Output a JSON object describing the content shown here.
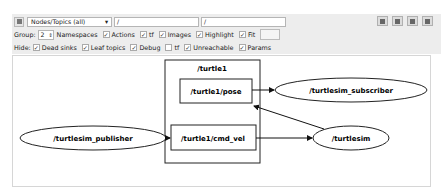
{
  "toolbar": {
    "refresh_icon": "refresh-graph-icon",
    "graph_type_select": "Nodes/Topics (all)",
    "node_filter_value": "/",
    "topic_filter_value": "/",
    "right_buttons": [
      "load-dot-icon",
      "save-dot-icon",
      "save-svg-icon",
      "save-image-icon"
    ]
  },
  "options_row": {
    "group_label": "Group:",
    "group_value": "2",
    "namespaces_label": "Namespaces",
    "namespaces_checked": true,
    "actions_label": "Actions",
    "actions_checked": true,
    "tf_label": "tf",
    "tf_checked": true,
    "images_label": "Images",
    "images_checked": true,
    "highlight_label": "Highlight",
    "highlight_checked": true,
    "fit_label": "Fit",
    "fit_checked": true
  },
  "hide_row": {
    "hide_label": "Hide:",
    "dead_sinks_label": "Dead sinks",
    "dead_sinks_checked": true,
    "leaf_topics_label": "Leaf topics",
    "leaf_topics_checked": true,
    "debug_label": "Debug",
    "debug_checked": true,
    "tf_label": "tf",
    "tf_checked": false,
    "unreachable_label": "Unreachable",
    "unreachable_checked": true,
    "params_label": "Params",
    "params_checked": true
  },
  "graph": {
    "group_label": "/turtle1",
    "topics": [
      "/turtle1/pose",
      "/turtle1/cmd_vel"
    ],
    "nodes": [
      "/turtlesim_publisher",
      "/turtlesim_subscriber",
      "/turtlesim"
    ],
    "edges": [
      {
        "from": "/turtlesim_publisher",
        "to": "/turtle1/cmd_vel"
      },
      {
        "from": "/turtle1/cmd_vel",
        "to": "/turtlesim"
      },
      {
        "from": "/turtlesim",
        "to": "/turtle1/pose"
      },
      {
        "from": "/turtle1/pose",
        "to": "/turtlesim_subscriber"
      }
    ]
  }
}
